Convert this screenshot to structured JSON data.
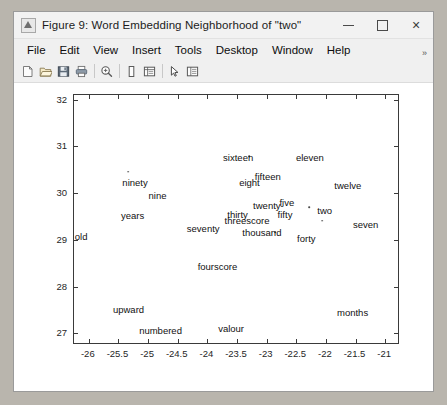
{
  "window": {
    "title": "Figure 9: Word Embedding Neighborhood of \"two\"",
    "icon": "matlab-figure-icon",
    "minimize_label": "",
    "maximize_label": "",
    "close_label": "×"
  },
  "menu": {
    "items": [
      {
        "label": "File"
      },
      {
        "label": "Edit"
      },
      {
        "label": "View"
      },
      {
        "label": "Insert"
      },
      {
        "label": "Tools"
      },
      {
        "label": "Desktop"
      },
      {
        "label": "Window"
      },
      {
        "label": "Help"
      }
    ],
    "overflow": "»"
  },
  "toolbar": {
    "buttons": [
      {
        "name": "new-figure-icon",
        "tip": "New Figure"
      },
      {
        "name": "open-file-icon",
        "tip": "Open File"
      },
      {
        "name": "save-figure-icon",
        "tip": "Save Figure"
      },
      {
        "name": "print-figure-icon",
        "tip": "Print Figure"
      },
      {
        "name": "zoom-in-icon",
        "tip": "Zoom In"
      },
      {
        "name": "insert-colorbar-icon",
        "tip": "Insert Colorbar"
      },
      {
        "name": "insert-legend-icon",
        "tip": "Insert Legend"
      },
      {
        "name": "edit-plot-icon",
        "tip": "Edit Plot"
      },
      {
        "name": "show-plot-tools-icon",
        "tip": "Show Plot Tools"
      }
    ]
  },
  "chart_data": {
    "type": "scatter",
    "title": "",
    "xlabel": "",
    "ylabel": "",
    "xlim": [
      -26.25,
      -20.75
    ],
    "ylim": [
      26.75,
      32.1
    ],
    "xticks": [
      -26,
      -25.5,
      -25,
      -24.5,
      -24,
      -23.5,
      -23,
      -22.5,
      -22,
      -21.5,
      -21
    ],
    "xticklabels": [
      "-26",
      "-25.5",
      "-25",
      "-24.5",
      "-24",
      "-23.5",
      "-23",
      "-22.5",
      "-22",
      "-21.5",
      "-21"
    ],
    "yticks": [
      27,
      28,
      29,
      30,
      31,
      32
    ],
    "yticklabels": [
      "27",
      "28",
      "29",
      "30",
      "31",
      "32"
    ],
    "grid": false,
    "legend": null,
    "marker_color": "#4a4a4a",
    "label_color": "#111111",
    "points": [
      {
        "label": "sixteen",
        "x": -23.48,
        "y": 30.78
      },
      {
        "label": "eleven",
        "x": -22.27,
        "y": 30.77
      },
      {
        "label": "ninety",
        "x": -25.22,
        "y": 30.24
      },
      {
        "label": "eight",
        "x": -23.29,
        "y": 30.24
      },
      {
        "label": "fifteen",
        "x": -22.98,
        "y": 30.36
      },
      {
        "label": "twelve",
        "x": -21.63,
        "y": 30.18
      },
      {
        "label": "nine",
        "x": -24.84,
        "y": 29.97
      },
      {
        "label": "twenty-",
        "x": -22.97,
        "y": 29.74
      },
      {
        "label": "five",
        "x": -22.66,
        "y": 29.8
      },
      {
        "label": "two",
        "x": -22.02,
        "y": 29.63
      },
      {
        "label": "years",
        "x": -25.26,
        "y": 29.54
      },
      {
        "label": "thirty",
        "x": -23.49,
        "y": 29.56
      },
      {
        "label": "fifty",
        "x": -22.69,
        "y": 29.55
      },
      {
        "label": "threescore",
        "x": -23.33,
        "y": 29.42
      },
      {
        "label": "seven",
        "x": -21.33,
        "y": 29.35
      },
      {
        "label": "seventy",
        "x": -24.07,
        "y": 29.25
      },
      {
        "label": "thousand",
        "x": -23.08,
        "y": 29.17
      },
      {
        "label": "old",
        "x": -26.13,
        "y": 29.09
      },
      {
        "label": "forty",
        "x": -22.33,
        "y": 29.05
      },
      {
        "label": "fourscore",
        "x": -23.83,
        "y": 28.44
      },
      {
        "label": "upward",
        "x": -25.33,
        "y": 27.53
      },
      {
        "label": "months",
        "x": -21.55,
        "y": 27.45
      },
      {
        "label": "numbered",
        "x": -24.79,
        "y": 27.07
      },
      {
        "label": "valour",
        "x": -23.6,
        "y": 27.11
      }
    ],
    "markers": [
      {
        "x": -23.29,
        "y": 30.79
      },
      {
        "x": -25.34,
        "y": 30.46
      },
      {
        "x": -22.28,
        "y": 29.7
      },
      {
        "x": -22.06,
        "y": 29.41
      },
      {
        "x": -22.86,
        "y": 29.16
      }
    ]
  }
}
